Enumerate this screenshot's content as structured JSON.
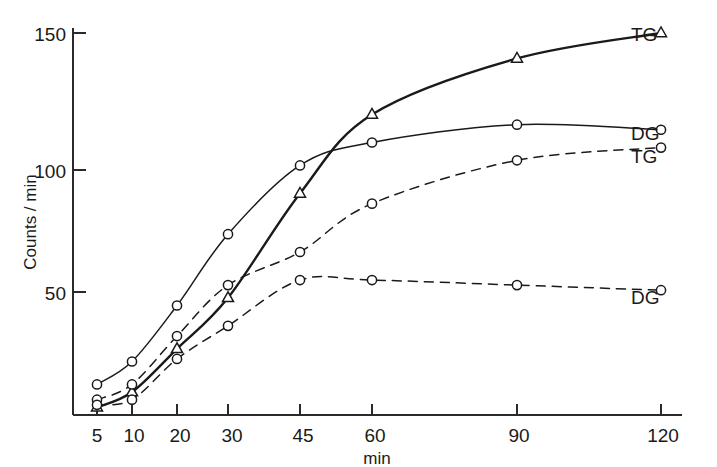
{
  "chart_data": {
    "type": "line",
    "title": "",
    "xlabel": "min",
    "ylabel": "Counts / min",
    "xticks": [
      5,
      10,
      20,
      30,
      45,
      60,
      90,
      120
    ],
    "xticklabels": [
      "5",
      "10",
      "20",
      "30",
      "45",
      "60",
      "90",
      "120"
    ],
    "yticks": [
      50,
      100,
      150
    ],
    "yticklabels": [
      "50",
      "100",
      "150"
    ],
    "xlim": [
      0,
      130
    ],
    "ylim": [
      0,
      158
    ],
    "grid": false,
    "legend_position": "right-inline",
    "x": [
      5,
      10,
      20,
      30,
      45,
      60,
      90,
      120
    ],
    "series": [
      {
        "name": "TG",
        "label": "TG",
        "marker": "triangle",
        "linestyle": "solid",
        "color": "#1a1a1a",
        "values": [
          3,
          9,
          26,
          46,
          87,
          118,
          140,
          150
        ]
      },
      {
        "name": "DG",
        "label": "DG",
        "marker": "circle",
        "linestyle": "solid",
        "color": "#1a1a1a",
        "values": [
          12,
          21,
          43,
          71,
          98,
          107,
          114,
          112
        ]
      },
      {
        "name": "TG-dashed",
        "label": "TG",
        "marker": "circle",
        "linestyle": "dashed",
        "color": "#1a1a1a",
        "values": [
          6,
          12,
          31,
          51,
          64,
          83,
          100,
          105
        ]
      },
      {
        "name": "DG-dashed",
        "label": "DG",
        "marker": "circle",
        "linestyle": "dashed",
        "color": "#1a1a1a",
        "values": [
          4,
          6,
          22,
          35,
          53,
          53,
          51,
          49
        ]
      }
    ]
  },
  "axes": {
    "y_title": "Counts / min",
    "x_title": "min"
  },
  "legend": [
    {
      "label": "TG",
      "marker": "triangle"
    },
    {
      "label": "DG",
      "marker": "circle"
    },
    {
      "label": "TG",
      "marker": "circle"
    },
    {
      "label": "DG",
      "marker": "circle"
    }
  ]
}
